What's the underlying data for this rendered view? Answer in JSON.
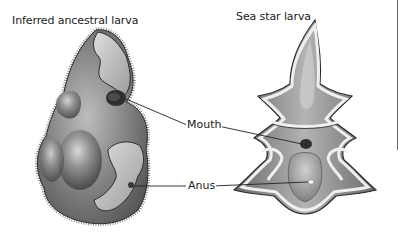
{
  "figure": {
    "panels": [
      {
        "title": "Inferred ancestral larva",
        "subject": "ancestral-larva-illustration"
      },
      {
        "title": "Sea star larva",
        "subject": "sea-star-larva-illustration"
      }
    ],
    "labels": {
      "mouth": "Mouth",
      "anus": "Anus"
    },
    "colors": {
      "body_dark": "#5e5e5e",
      "body_mid": "#8a8a8a",
      "body_light": "#c9c9c9",
      "band": "#e6e6e6",
      "leader_line": "#222222",
      "text": "#1a1a1a"
    }
  }
}
